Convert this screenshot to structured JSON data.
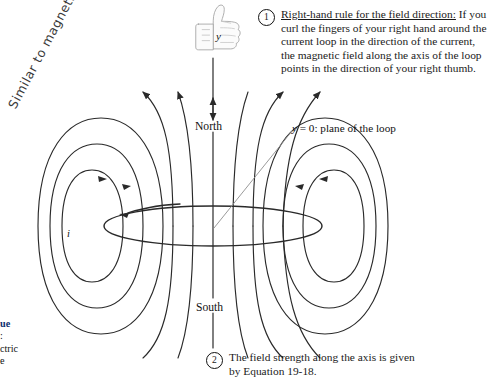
{
  "figure": {
    "callouts": [
      {
        "number": "1",
        "lead": "Right-hand rule for the field direction:",
        "text": " If you curl the fingers of your right hand around the current loop in the direction of the current, the magnetic field along the axis of the loop points in the direction of your right thumb."
      },
      {
        "number": "2",
        "text": "The field strength along the axis is given by Equation 19-18."
      }
    ],
    "labels": {
      "y_axis": "y",
      "north": "North",
      "south": "South",
      "plane_var": "y",
      "plane_rest": " = 0: plane of the loop",
      "current": "i"
    },
    "annotation": {
      "handwritten": "Similar to magnetic bar"
    },
    "margin_fragment": {
      "bold_line": "ue",
      "line2": ":",
      "line3": "ctric",
      "line4": "e"
    },
    "icons": {
      "thumbs_up": "thumbs-up-icon"
    },
    "colors": {
      "ink": "#1a1a1a",
      "field_line": "#2a2a2a",
      "leader": "#8a8a8a",
      "margin_accent": "#0d2f6e"
    }
  }
}
